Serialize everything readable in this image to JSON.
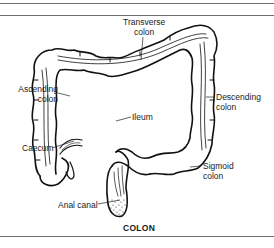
{
  "figure": {
    "caption": "COLON",
    "labels": {
      "transverse": [
        "Transverse",
        "colon"
      ],
      "ascending": [
        "Ascending",
        "colon"
      ],
      "descending": [
        "Descending",
        "colon"
      ],
      "ileum": "Ileum",
      "caecum": "Caecum",
      "sigmoid": [
        "Sigmoid",
        "colon"
      ],
      "anal_canal": "Anal canal"
    }
  }
}
